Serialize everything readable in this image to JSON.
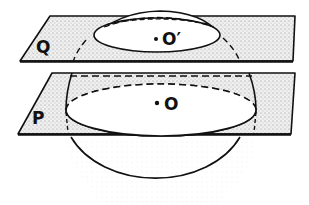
{
  "figure": {
    "planes": [
      {
        "id": "Q",
        "label": "Q",
        "position": "upper"
      },
      {
        "id": "P",
        "label": "P",
        "position": "lower"
      }
    ],
    "sphere": {
      "description": "sphere cut by two parallel planes"
    },
    "centers": [
      {
        "id": "O_prime",
        "label": "O′",
        "on_plane": "Q",
        "meaning": "center of small circle cut by plane Q"
      },
      {
        "id": "O",
        "label": "O",
        "on_plane": "P",
        "meaning": "center of sphere / great circle cut by plane P"
      }
    ],
    "colors": {
      "ink": "#111111",
      "plane_fill": "#e4e4e4",
      "stipple": "#8a8a8a",
      "background": "#ffffff"
    }
  }
}
